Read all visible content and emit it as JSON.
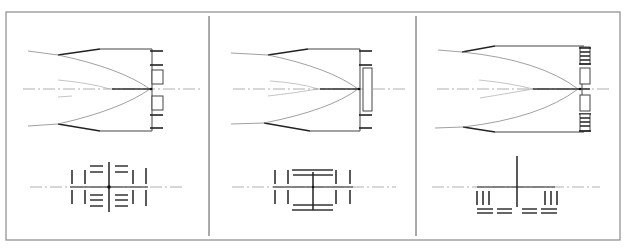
{
  "figure": {
    "colors": {
      "line": "#222222",
      "frame": "#8a8a8a",
      "axis": "#999999",
      "background": "#ffffff"
    },
    "panels": [
      {
        "id": "panel-1",
        "top_view": {
          "aperture_elements": "two split boxes with four ticks"
        },
        "bottom_view": {
          "layout": "bars with horizontal dash stacks and center dot"
        }
      },
      {
        "id": "panel-2",
        "top_view": {
          "aperture_elements": "single tall box with four ticks"
        },
        "bottom_view": {
          "layout": "bracket frame with central cross"
        }
      },
      {
        "id": "panel-3",
        "top_view": {
          "aperture_elements": "stacked segmented boxes"
        },
        "bottom_view": {
          "layout": "inverted T with side bar groups and dash rows"
        }
      }
    ]
  }
}
